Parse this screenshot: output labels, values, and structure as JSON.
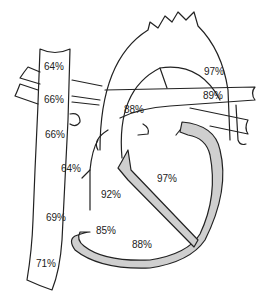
{
  "diagram": {
    "colors": {
      "line": "#222222",
      "wall_fill": "#cfcfcf",
      "background": "#ffffff"
    },
    "labels": [
      {
        "id": "svc-upper",
        "text": "64%",
        "x": 44,
        "y": 62
      },
      {
        "id": "svc-mid",
        "text": "66%",
        "x": 44,
        "y": 95
      },
      {
        "id": "svc-lower",
        "text": "66%",
        "x": 45,
        "y": 130
      },
      {
        "id": "ra-upper",
        "text": "64%",
        "x": 61,
        "y": 164
      },
      {
        "id": "ivc-junction",
        "text": "69%",
        "x": 46,
        "y": 213
      },
      {
        "id": "ivc",
        "text": "71%",
        "x": 36,
        "y": 259
      },
      {
        "id": "aorta",
        "text": "97%",
        "x": 204,
        "y": 67
      },
      {
        "id": "pulmonary-vein",
        "text": "89%",
        "x": 203,
        "y": 91
      },
      {
        "id": "left-atrium",
        "text": "88%",
        "x": 124,
        "y": 105
      },
      {
        "id": "left-ventricle",
        "text": "97%",
        "x": 157,
        "y": 174
      },
      {
        "id": "septal-region",
        "text": "92%",
        "x": 101,
        "y": 190
      },
      {
        "id": "right-ventricle-inflow",
        "text": "85%",
        "x": 96,
        "y": 226
      },
      {
        "id": "right-ventricle",
        "text": "88%",
        "x": 132,
        "y": 240
      }
    ]
  }
}
